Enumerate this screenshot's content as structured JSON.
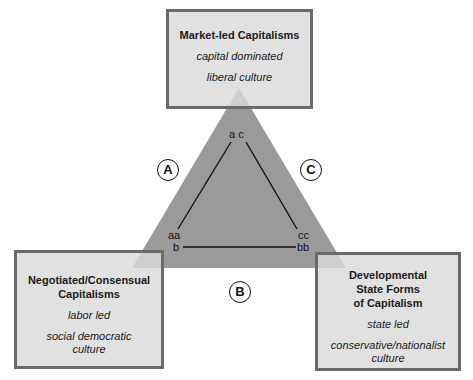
{
  "boxes": {
    "top": {
      "title": "Market-led Capitalisms",
      "line1": "capital dominated",
      "line2": "liberal culture"
    },
    "left": {
      "title_line1": "Negotiated/Consensual",
      "title_line2": "Capitalisms",
      "line1": "labor led",
      "line2a": "social democratic",
      "line2b": "culture"
    },
    "right": {
      "title_line1": "Developmental",
      "title_line2": "State Forms",
      "title_line3": "of Capitalism",
      "line1": "state led",
      "line2a": "conservative/nationalist",
      "line2b": "culture"
    }
  },
  "circles": {
    "a": "A",
    "b": "B",
    "c": "C"
  },
  "vertex_labels": {
    "top": "a c",
    "bottom_left_upper": "aa",
    "bottom_left_lower": "b",
    "bottom_right_upper": "cc",
    "bottom_right_lower": "bb"
  },
  "colors": {
    "triangle_fill": "#9a9a9a",
    "box_fill": "#dadada",
    "box_border": "#6a6a6a"
  }
}
